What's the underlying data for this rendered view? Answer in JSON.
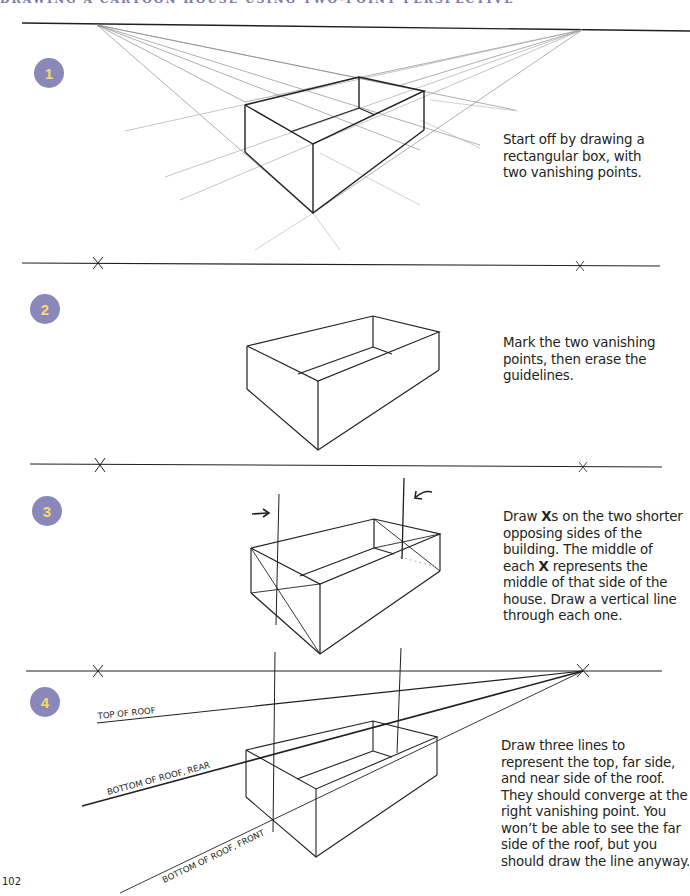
{
  "running_head": "DRAWING A CARTOON HOUSE USING TWO-POINT PERSPECTIVE",
  "colors": {
    "badge_bg": "#8a88b8",
    "badge_text": "#f2dc6a",
    "ink": "#231f20",
    "guide": "#8c8c8c"
  },
  "steps": [
    {
      "number": "1",
      "caption": "Start off by drawing a rectangular box, with two vanishing points."
    },
    {
      "number": "2",
      "caption": "Mark the two vanishing points, then erase the guidelines."
    },
    {
      "number": "3",
      "caption_parts": [
        "Draw ",
        "X",
        "s on the two shorter opposing sides of the building. The middle of each ",
        "X",
        " represents the middle of that side of the house. Draw a vertical line through each one."
      ]
    },
    {
      "number": "4",
      "caption": "Draw three lines to represent the top, far side, and near side of the roof. They should converge at the right vanishing point. You won’t be able to see the far side of the roof, but you should draw the line anyway."
    }
  ],
  "roof_labels": {
    "top": "TOP OF ROOF",
    "rear": "BOTTOM OF ROOF, REAR",
    "front": "BOTTOM OF ROOF, FRONT"
  },
  "page_number": "102"
}
